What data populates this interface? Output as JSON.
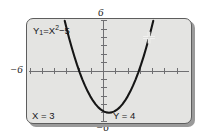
{
  "figure": {
    "kind": "graphing-calculator-screen",
    "outer_axis_labels": {
      "top": "6",
      "bottom": "−6",
      "left": "−6",
      "right": "6"
    }
  },
  "screen": {
    "equation_label": {
      "full": "Y1=X²−5",
      "function_name": "Y",
      "function_index": "1",
      "equals": "=",
      "variable": "X",
      "exponent": "2",
      "rest": "−5"
    },
    "trace_readout": {
      "x_label": "X = 3",
      "y_label": "Y = 4"
    },
    "cursor": {
      "name": "trace-cursor",
      "glyph": "plus-cross",
      "x_value": 3,
      "y_value": 4
    }
  },
  "chart_data": {
    "type": "line",
    "subtitle": "",
    "xlabel": "",
    "ylabel": "",
    "xlim": [
      -6,
      6
    ],
    "ylim": [
      -6,
      6
    ],
    "xticks": [
      -6,
      -5,
      -4,
      -3,
      -2,
      -1,
      0,
      1,
      2,
      3,
      4,
      5,
      6
    ],
    "yticks": [
      -6,
      -5,
      -4,
      -3,
      -2,
      -1,
      0,
      1,
      2,
      3,
      4,
      5,
      6
    ],
    "tick_labels_shown": [
      "-6",
      "6"
    ],
    "grid": false,
    "legend": "none",
    "axis_style": "crosshair-with-tick-marks",
    "series": [
      {
        "name": "Y1=X²−5",
        "expression": "y = x^2 - 5",
        "color": "#151515",
        "x": [
          -3.32,
          -3.2,
          -3.0,
          -2.8,
          -2.6,
          -2.4,
          -2.2,
          -2.0,
          -1.8,
          -1.6,
          -1.4,
          -1.2,
          -1.0,
          -0.8,
          -0.6,
          -0.4,
          -0.2,
          0.0,
          0.2,
          0.4,
          0.6,
          0.8,
          1.0,
          1.2,
          1.4,
          1.6,
          1.8,
          2.0,
          2.2,
          2.4,
          2.6,
          2.8,
          3.0,
          3.2,
          3.32
        ],
        "y": [
          6.02,
          5.24,
          4.0,
          2.84,
          1.76,
          0.76,
          -0.16,
          -1.0,
          -1.76,
          -2.44,
          -3.04,
          -3.56,
          -4.0,
          -4.36,
          -4.64,
          -4.84,
          -4.96,
          -5.0,
          -4.96,
          -4.84,
          -4.64,
          -4.36,
          -4.0,
          -3.56,
          -3.04,
          -2.44,
          -1.76,
          -1.0,
          -0.16,
          0.76,
          1.76,
          2.84,
          4.0,
          5.24,
          6.02
        ]
      }
    ],
    "annotations": [
      {
        "name": "trace-cursor",
        "x": 3,
        "y": 4,
        "label": "X = 3   Y = 4"
      },
      {
        "name": "vertex",
        "x": 0,
        "y": -5,
        "label": ""
      }
    ]
  }
}
